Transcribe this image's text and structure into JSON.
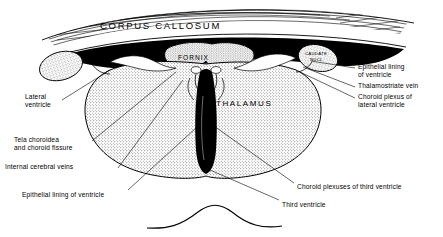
{
  "figure": {
    "style": "black-and-white stippled anatomical line drawing",
    "colors": {
      "ink": "#000000",
      "paper": "#ffffff",
      "stipple_gray": "#9a9a9a",
      "ventricle_black": "#000000"
    }
  },
  "interior_labels": [
    {
      "id": "corpus-callosum",
      "text": "CORPUS  CALLOSUM",
      "x": 100,
      "y": 26,
      "size": 9.5,
      "spacing": 1.6
    },
    {
      "id": "fornix",
      "text": "FORNIX",
      "x": 176,
      "y": 57,
      "size": 6.6,
      "spacing": 1.0
    },
    {
      "id": "thalamus",
      "text": "THALAMUS",
      "x": 216,
      "y": 103,
      "size": 8.0,
      "spacing": 1.5
    },
    {
      "id": "caudate-nucleus",
      "text": "CAUDATE\nNUCL.",
      "x": 312,
      "y": 49,
      "size": 4.4,
      "spacing": 0.3
    }
  ],
  "callout_labels": {
    "right": [
      {
        "id": "epithelial-lining-of-ventricle",
        "text": "Epithelial lining\nof ventricle",
        "x": 358,
        "y": 66
      },
      {
        "id": "thalamostriate-vein",
        "text": "Thalamostriate vein",
        "x": 358,
        "y": 85
      },
      {
        "id": "choroid-plexus-of-lateral-ventricle",
        "text": "Choroid plexus of\nlateral ventricle",
        "x": 358,
        "y": 96
      }
    ],
    "left": [
      {
        "id": "lateral-ventricle",
        "text": "Lateral\nventricle",
        "x": 25,
        "y": 96
      },
      {
        "id": "tela-choroidea",
        "text": "Tela choroidea\nand choroid fissure",
        "x": 14,
        "y": 139
      },
      {
        "id": "internal-cerebral-veins",
        "text": "Internal cerebral veins",
        "x": 5,
        "y": 166
      }
    ],
    "bottom": [
      {
        "id": "epithelial-lining-of-ventricle-2",
        "text": "Epithelial lining of ventricle",
        "x": 22,
        "y": 194
      },
      {
        "id": "choroid-plexuses-of-third-ventricle",
        "text": "Choroid plexuses of third ventricle",
        "x": 297,
        "y": 186
      },
      {
        "id": "third-ventricle",
        "text": "Third ventricle",
        "x": 282,
        "y": 204
      }
    ]
  },
  "leader_lines": [
    {
      "id": "leader-epithelial-right",
      "from": [
        355,
        68
      ],
      "to": [
        311,
        61
      ]
    },
    {
      "id": "leader-thalamostriate",
      "from": [
        355,
        87
      ],
      "to": [
        303,
        67
      ]
    },
    {
      "id": "leader-choroid-lateral",
      "from": [
        355,
        98
      ],
      "to": [
        300,
        72
      ]
    },
    {
      "id": "leader-lateral-ventricle",
      "from": [
        62,
        100
      ],
      "to": [
        110,
        70
      ]
    },
    {
      "id": "leader-tela-choroidea",
      "from": [
        92,
        141
      ],
      "to": [
        176,
        72
      ]
    },
    {
      "id": "leader-internal-veins",
      "from": [
        118,
        168
      ],
      "to": [
        183,
        80
      ]
    },
    {
      "id": "leader-epithelial-bottom",
      "from": [
        128,
        190
      ],
      "to": [
        196,
        128
      ]
    },
    {
      "id": "leader-choroid-third",
      "from": [
        294,
        183
      ],
      "to": [
        214,
        126
      ]
    },
    {
      "id": "leader-third-ventricle",
      "from": [
        279,
        200
      ],
      "to": [
        210,
        170
      ]
    }
  ]
}
